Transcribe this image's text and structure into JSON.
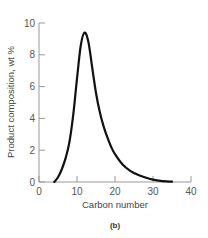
{
  "chart_data": {
    "type": "line",
    "title": "",
    "panel_label": "(b)",
    "xlabel": "Carbon number",
    "ylabel": "Product composition, wt %",
    "xlim": [
      0,
      40
    ],
    "ylim": [
      0,
      10
    ],
    "xticks": [
      0,
      10,
      20,
      30,
      40
    ],
    "yticks": [
      0,
      2,
      4,
      6,
      8,
      10
    ],
    "grid": false,
    "legend": null,
    "series": [
      {
        "name": "Product distribution",
        "x": [
          4,
          5,
          6,
          7,
          8,
          9,
          10,
          11,
          12,
          13,
          14,
          15,
          16,
          17,
          18,
          19,
          20,
          22,
          24,
          26,
          28,
          30,
          32,
          35
        ],
        "y": [
          0,
          0.3,
          0.8,
          1.5,
          2.5,
          4.2,
          6.5,
          8.6,
          9.4,
          8.8,
          7.2,
          5.6,
          4.4,
          3.5,
          2.8,
          2.2,
          1.75,
          1.1,
          0.7,
          0.45,
          0.28,
          0.15,
          0.07,
          0.02
        ]
      }
    ]
  }
}
